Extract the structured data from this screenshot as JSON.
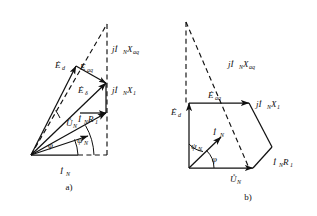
{
  "figure": {
    "background_color": "#ffffff",
    "ink_color": "#111111",
    "width": 317,
    "height": 216
  },
  "diagram_a": {
    "caption": "a)",
    "labels": {
      "e_d": "Ė",
      "e_d_sub": "d",
      "e_aq": "Ė",
      "e_aq_sub": "aq",
      "e_delta": "Ė",
      "e_delta_sub": "δ",
      "u_n": "Ů",
      "u_n_sub": "N",
      "i_n_r1": "İ",
      "i_n_r1_sub": "N",
      "i_n_r1_tail": "R",
      "i_n_r1_tail_sub": "1",
      "jx1": "jİ",
      "jx1_sub": "N",
      "jx1_tail": "X",
      "jx1_tail_sub": "1",
      "jxaq": "jİ",
      "jxaq_sub": "N",
      "jxaq_tail": "X",
      "jxaq_tail_sub": "aq",
      "i_n": "İ",
      "i_n_sub": "N",
      "psi_n": "ψ",
      "psi_n_sub": "N",
      "phi": "φ"
    }
  },
  "diagram_b": {
    "caption": "b)",
    "labels": {
      "e_d": "Ė",
      "e_d_sub": "d",
      "e_aq": "Ė",
      "e_aq_sub": "aq",
      "u_n": "Ů",
      "u_n_sub": "N",
      "i_n_r1": "İ",
      "i_n_r1_sub": "N",
      "i_n_r1_tail": "R",
      "i_n_r1_tail_sub": "1",
      "jx1": "jİ",
      "jx1_sub": "N",
      "jx1_tail": "X",
      "jx1_tail_sub": "1",
      "jxaq": "jİ",
      "jxaq_sub": "N",
      "jxaq_tail": "X",
      "jxaq_tail_sub": "aq",
      "i_n": "İ",
      "i_n_sub": "N",
      "psi_n": "ψ",
      "psi_n_sub": "N",
      "phi": "φ"
    }
  }
}
